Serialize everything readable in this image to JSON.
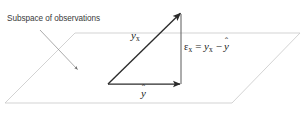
{
  "figure": {
    "type": "vector-decomposition-diagram",
    "background_color": "#ffffff",
    "line_color_plane": "#c9c9c9",
    "line_color_vector": "#2b2b2b",
    "text_color": "#231f20",
    "caption": {
      "label": "Subspace of observations"
    },
    "labels": {
      "hypotenuse": {
        "symbol": "y",
        "subscript": "x"
      },
      "base": {
        "symbol": "y",
        "accent": "̂"
      },
      "vertical": {
        "epsilon": "ε",
        "epsilon_subscript": "x",
        "equals": "=",
        "term1_symbol": "y",
        "term1_subscript": "x",
        "minus": "−",
        "term2_symbol": "y",
        "term2_accent": "̂"
      }
    },
    "geometry": {
      "plane_points": "5,103 75,33 300,33 232,103",
      "triangle_apex": [
        181,
        12
      ],
      "triangle_right_angle": [
        181,
        84
      ],
      "triangle_origin": [
        108,
        84
      ],
      "leader_start": [
        40,
        30
      ],
      "leader_tip": [
        79,
        71
      ]
    }
  }
}
